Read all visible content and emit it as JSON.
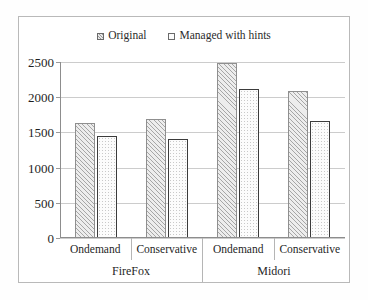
{
  "chart_data": {
    "type": "bar",
    "title": "",
    "xlabel": "",
    "ylabel": "",
    "ylim": [
      0,
      2500
    ],
    "yticks": [
      0,
      500,
      1000,
      1500,
      2000,
      2500
    ],
    "ytick_labels": [
      "0",
      "500",
      "1000",
      "1500",
      "2000",
      "2500"
    ],
    "grid": true,
    "legend_position": "top-center",
    "categories": [
      "Ondemand",
      "Conservative",
      "Ondemand",
      "Conservative"
    ],
    "group_labels": [
      "FireFox",
      "Midori"
    ],
    "groups": [
      {
        "name": "FireFox",
        "categories": [
          "Ondemand",
          "Conservative"
        ]
      },
      {
        "name": "Midori",
        "categories": [
          "Ondemand",
          "Conservative"
        ]
      }
    ],
    "series": [
      {
        "name": "Original",
        "pattern": "diagonal-hatch",
        "values": [
          1630,
          1690,
          2480,
          2090
        ]
      },
      {
        "name": "Managed with hints",
        "pattern": "dotted",
        "values": [
          1450,
          1410,
          2115,
          1660
        ]
      }
    ]
  },
  "legend": {
    "entries": [
      {
        "label": "Original",
        "swatch": "hatch-swatch-icon"
      },
      {
        "label": "Managed with hints",
        "swatch": "dots-swatch-icon"
      }
    ]
  },
  "axis": {
    "y_labels": [
      "2500",
      "2000",
      "1500",
      "1000",
      "500",
      "0"
    ]
  },
  "categories": {
    "sub": [
      "Ondemand",
      "Conservative",
      "Ondemand",
      "Conservative"
    ],
    "main": [
      "FireFox",
      "Midori"
    ]
  },
  "colors": {
    "frame": "#b9b9b9",
    "axis": "#8d8d8d",
    "gridline": "#cccccc",
    "series_original_fill": "#ededed",
    "series_original_hatch": "#a6a6a6",
    "series_managed_fill": "#fcfcfc",
    "series_managed_border": "#3b3b3b",
    "text": "#1f1f1f",
    "background": "#ffffff"
  }
}
